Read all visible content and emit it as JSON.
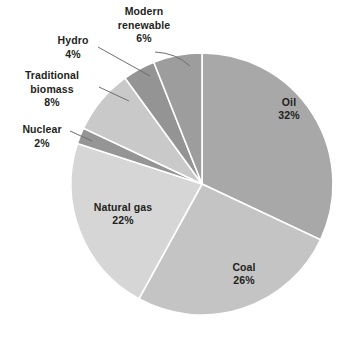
{
  "chart_data": {
    "type": "pie",
    "title": "",
    "subtitle": "",
    "xlabel": "",
    "ylabel": "",
    "legend_position": "none",
    "grid": false,
    "units": "%",
    "total": 100,
    "start_angle_deg": 0,
    "direction": "clockwise",
    "categories": [
      "Oil",
      "Coal",
      "Natural gas",
      "Nuclear",
      "Traditional biomass",
      "Hydro",
      "Modern renewable"
    ],
    "values": [
      32,
      26,
      22,
      2,
      8,
      4,
      6
    ],
    "slices": [
      {
        "label": "Oil",
        "value": 32,
        "value_text": "32%",
        "color": "#a8a8a8",
        "label_placement": "inside",
        "label_x": 289,
        "label_y": 104
      },
      {
        "label": "Coal",
        "value": 26,
        "value_text": "26%",
        "color": "#c4c4c4",
        "label_placement": "inside",
        "label_x": 244,
        "label_y": 269
      },
      {
        "label": "Natural gas",
        "value": 22,
        "value_text": "22%",
        "color": "#d6d6d6",
        "label_placement": "inside",
        "label_x": 123,
        "label_y": 208
      },
      {
        "label": "Nuclear",
        "value": 2,
        "value_text": "2%",
        "color": "#959595",
        "label_placement": "outside",
        "label_x": 43,
        "label_y": 128
      },
      {
        "label": "Traditional biomass",
        "value": 8,
        "value_text": "8%",
        "color": "#c9c9c9",
        "label_placement": "outside",
        "label_x": 49,
        "label_y": 76
      },
      {
        "label": "Hydro",
        "value": 4,
        "value_text": "4%",
        "color": "#949494",
        "label_placement": "outside",
        "label_x": 73,
        "label_y": 40
      },
      {
        "label": "Modern renewable",
        "value": 6,
        "value_text": "6%",
        "color": "#9d9d9d",
        "label_placement": "outside",
        "label_x": 144,
        "label_y": 11
      }
    ]
  },
  "labels": {
    "oil": {
      "name": "Oil",
      "value": "32%"
    },
    "coal": {
      "name": "Coal",
      "value": "26%"
    },
    "natural_gas": {
      "name": "Natural gas",
      "value": "22%"
    },
    "nuclear": {
      "name": "Nuclear",
      "value": "2%"
    },
    "traditional_biomass": {
      "name_line1": "Traditional",
      "name_line2": "biomass",
      "value": "8%"
    },
    "hydro": {
      "name": "Hydro",
      "value": "4%"
    },
    "modern_renewable": {
      "name_line1": "Modern",
      "name_line2": "renewable",
      "value": "6%"
    }
  },
  "geometry": {
    "center_x": 202,
    "center_y": 184,
    "radius": 131
  }
}
